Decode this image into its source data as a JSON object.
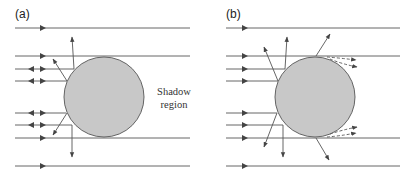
{
  "figure": {
    "panels": [
      {
        "id": "a",
        "label": "(a)",
        "annotation_line1": "Shadow",
        "annotation_line2": "region",
        "description": "Incident parallel rays on a sphere: reflected/backscattered rays near edges, shadow region behind"
      },
      {
        "id": "b",
        "label": "(b)",
        "description": "Incident parallel rays on a sphere with scattered rays and dashed diffracted rays bending into shadow region at top and bottom tangents"
      }
    ],
    "colors": {
      "sphere_fill": "#c8c8c8",
      "sphere_stroke": "#555555",
      "line": "#555555",
      "background": "#ffffff"
    }
  }
}
